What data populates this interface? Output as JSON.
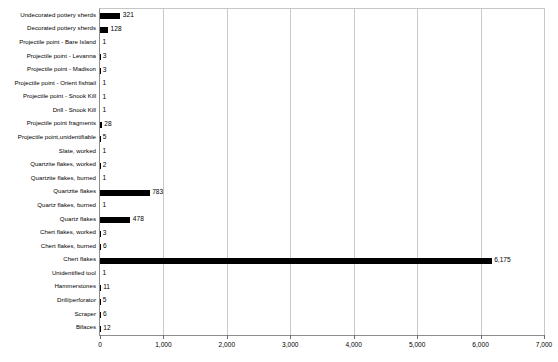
{
  "chart_data": {
    "type": "bar",
    "orientation": "horizontal",
    "title": "",
    "subtitle": "",
    "xlabel": "",
    "ylabel": "",
    "xlim": [
      0,
      7000
    ],
    "grid": true,
    "legend": null,
    "xticks": [
      0,
      1000,
      2000,
      3000,
      4000,
      5000,
      6000,
      7000
    ],
    "xtick_labels": [
      "0",
      "1,000",
      "2,000",
      "3,000",
      "4,000",
      "5,000",
      "6,000",
      "7,000"
    ],
    "categories": [
      "Undecorated pottery sherds",
      "Decorated pottery sherds",
      "Projectile point - Bare Island",
      "Projectile point - Levanna",
      "Projectile point - Madison",
      "Projectile point - Orient fishtail",
      "Projectile point - Snook Kill",
      "Drill - Snook Kill",
      "Projectile point fragments",
      "Projectile point,unidentifiable",
      "Slate, worked",
      "Quartzite flakes, worked",
      "Quartzite flakes, burned",
      "Quartzite flakes",
      "Quartz flakes, burned",
      "Quartz flakes",
      "Chert flakes, worked",
      "Chert flakes, burned",
      "Chert flakes",
      "Unidentified tool",
      "Hammerstones",
      "Drill/perforator",
      "Scraper",
      "Bifaces"
    ],
    "values": [
      321,
      128,
      1,
      3,
      3,
      1,
      1,
      1,
      28,
      5,
      1,
      2,
      1,
      783,
      1,
      478,
      3,
      6,
      6175,
      1,
      11,
      5,
      6,
      12
    ],
    "value_labels": [
      "321",
      "128",
      "1",
      "3",
      "3",
      "1",
      "1",
      "1",
      "28",
      "5",
      "1",
      "2",
      "1",
      "783",
      "1",
      "478",
      "3",
      "6",
      "6,175",
      "1",
      "11",
      "5",
      "6",
      "12"
    ],
    "bar_color": "#000000",
    "grid_color": "#c9c9c9",
    "axis_color": "#8d8d8d",
    "background_color": "#ffffff"
  }
}
